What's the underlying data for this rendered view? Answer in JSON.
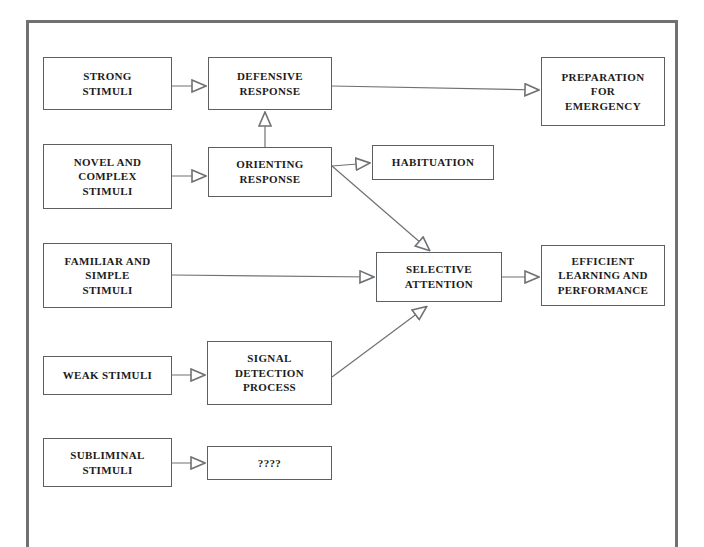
{
  "diagram": {
    "type": "flowchart",
    "stroke_color": "#6f7173",
    "text_color": "#1c1c1c",
    "background": "#ffffff",
    "nodes": [
      {
        "id": "strong-stimuli",
        "label": "STRONG\nSTIMULI",
        "x": 43,
        "y": 57,
        "w": 129,
        "h": 53
      },
      {
        "id": "defensive-response",
        "label": "DEFENSIVE\nRESPONSE",
        "x": 208,
        "y": 57,
        "w": 124,
        "h": 53
      },
      {
        "id": "preparation-emergency",
        "label": "PREPARATION\nFOR\nEMERGENCY",
        "x": 541,
        "y": 57,
        "w": 124,
        "h": 69
      },
      {
        "id": "novel-complex-stimuli",
        "label": "NOVEL AND\nCOMPLEX\nSTIMULI",
        "x": 43,
        "y": 144,
        "w": 129,
        "h": 65
      },
      {
        "id": "orienting-response",
        "label": "ORIENTING\nRESPONSE",
        "x": 208,
        "y": 147,
        "w": 124,
        "h": 50
      },
      {
        "id": "habituation",
        "label": "HABITUATION",
        "x": 372,
        "y": 145,
        "w": 122,
        "h": 35
      },
      {
        "id": "familiar-simple-stimuli",
        "label": "FAMILIAR AND\nSIMPLE\nSTIMULI",
        "x": 43,
        "y": 243,
        "w": 129,
        "h": 65
      },
      {
        "id": "selective-attention",
        "label": "SELECTIVE\nATTENTION",
        "x": 376,
        "y": 252,
        "w": 126,
        "h": 50
      },
      {
        "id": "efficient-learning",
        "label": "EFFICIENT\nLEARNING AND\nPERFORMANCE",
        "x": 541,
        "y": 245,
        "w": 124,
        "h": 61
      },
      {
        "id": "weak-stimuli",
        "label": "WEAK STIMULI",
        "x": 43,
        "y": 356,
        "w": 129,
        "h": 39
      },
      {
        "id": "signal-detection",
        "label": "SIGNAL\nDETECTION\nPROCESS",
        "x": 207,
        "y": 341,
        "w": 125,
        "h": 64
      },
      {
        "id": "subliminal-stimuli",
        "label": "SUBLIMINAL\nSTIMULI",
        "x": 43,
        "y": 438,
        "w": 129,
        "h": 49
      },
      {
        "id": "unknown-outcome",
        "label": "????",
        "x": 207,
        "y": 446,
        "w": 125,
        "h": 34
      }
    ],
    "edges": [
      {
        "id": "edge-strong-to-defensive",
        "from": "strong-stimuli",
        "to": "defensive-response",
        "kind": "horizontal"
      },
      {
        "id": "edge-defensive-to-preparation",
        "from": "defensive-response",
        "to": "preparation-emergency",
        "kind": "horizontal"
      },
      {
        "id": "edge-orienting-to-defensive",
        "from": "orienting-response",
        "to": "defensive-response",
        "kind": "vertical-up"
      },
      {
        "id": "edge-novel-to-orienting",
        "from": "novel-complex-stimuli",
        "to": "orienting-response",
        "kind": "horizontal"
      },
      {
        "id": "edge-orienting-to-habituation",
        "from": "orienting-response",
        "to": "habituation",
        "kind": "horizontal"
      },
      {
        "id": "edge-orienting-to-selective",
        "from": "orienting-response",
        "to": "selective-attention",
        "kind": "diagonal-down"
      },
      {
        "id": "edge-familiar-to-selective",
        "from": "familiar-simple-stimuli",
        "to": "selective-attention",
        "kind": "horizontal"
      },
      {
        "id": "edge-selective-to-efficient",
        "from": "selective-attention",
        "to": "efficient-learning",
        "kind": "horizontal"
      },
      {
        "id": "edge-weak-to-signal",
        "from": "weak-stimuli",
        "to": "signal-detection",
        "kind": "horizontal"
      },
      {
        "id": "edge-signal-to-selective",
        "from": "signal-detection",
        "to": "selective-attention",
        "kind": "diagonal-up"
      },
      {
        "id": "edge-subliminal-to-unknown",
        "from": "subliminal-stimuli",
        "to": "unknown-outcome",
        "kind": "horizontal"
      }
    ]
  }
}
